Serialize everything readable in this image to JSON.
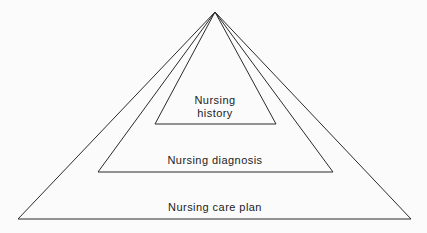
{
  "diagram": {
    "type": "nested-triangles",
    "background_color": "#fbfbfb",
    "line_color": "#2b2b2b",
    "text_color": "#1c1c1c",
    "apex": {
      "x": 215,
      "y": 12
    },
    "levels": [
      {
        "name": "nursing-history",
        "label": "Nursing\nhistory",
        "label_lines": [
          "Nursing",
          "history"
        ],
        "base_left": {
          "x": 155,
          "y": 124
        },
        "base_right": {
          "x": 276,
          "y": 124
        },
        "label_center": {
          "x": 215,
          "y": 107
        }
      },
      {
        "name": "nursing-diagnosis",
        "label": "Nursing diagnosis",
        "label_lines": [
          "Nursing diagnosis"
        ],
        "base_left": {
          "x": 98,
          "y": 172
        },
        "base_right": {
          "x": 333,
          "y": 172
        },
        "label_center": {
          "x": 215,
          "y": 160
        }
      },
      {
        "name": "nursing-care-plan",
        "label": "Nursing care plan",
        "label_lines": [
          "Nursing care plan"
        ],
        "base_left": {
          "x": 18,
          "y": 219
        },
        "base_right": {
          "x": 411,
          "y": 219
        },
        "label_center": {
          "x": 215,
          "y": 207
        }
      }
    ]
  },
  "chart_data": {
    "type": "diagram",
    "title": "",
    "subtitle": "",
    "shape": "nested triangles sharing a common apex",
    "categories": [
      "Nursing history",
      "Nursing diagnosis",
      "Nursing care plan"
    ],
    "hierarchy_order": [
      "Nursing history",
      "Nursing diagnosis",
      "Nursing care plan"
    ],
    "annotations": [
      "Nursing history",
      "Nursing diagnosis",
      "Nursing care plan"
    ],
    "legend": [],
    "grid": false
  }
}
